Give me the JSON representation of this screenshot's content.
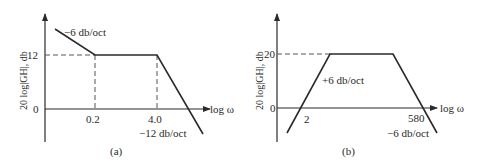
{
  "figures": [
    {
      "id": "a",
      "caption": "(a)",
      "y_axis_label": "20 log|GH|, db",
      "x_axis_label": "log ω",
      "y_ticks": [
        "12",
        "0"
      ],
      "x_ticks": [
        "0.2",
        "4.0"
      ],
      "annotations": [
        "−6 db/oct",
        "−12 db/oct"
      ],
      "segments": [
        {
          "slope": "-6 db/oct",
          "until": "0.2"
        },
        {
          "level": "12 db",
          "from": "0.2",
          "to": "4.0"
        },
        {
          "slope": "-12 db/oct",
          "from": "4.0"
        }
      ]
    },
    {
      "id": "b",
      "caption": "(b)",
      "y_axis_label": "20 log|GH|, db",
      "x_axis_label": "log ω",
      "y_ticks": [
        "20",
        "0"
      ],
      "x_ticks": [
        "2",
        "580"
      ],
      "annotations": [
        "+6 db/oct",
        "−6 db/oct"
      ],
      "segments": [
        {
          "slope": "+6 db/oct",
          "zero_crossing": "2"
        },
        {
          "level": "20 db"
        },
        {
          "slope": "-6 db/oct",
          "zero_crossing": "580"
        }
      ]
    }
  ],
  "colors": {
    "ink": "#2a2a2a",
    "background": "#ffffff"
  }
}
